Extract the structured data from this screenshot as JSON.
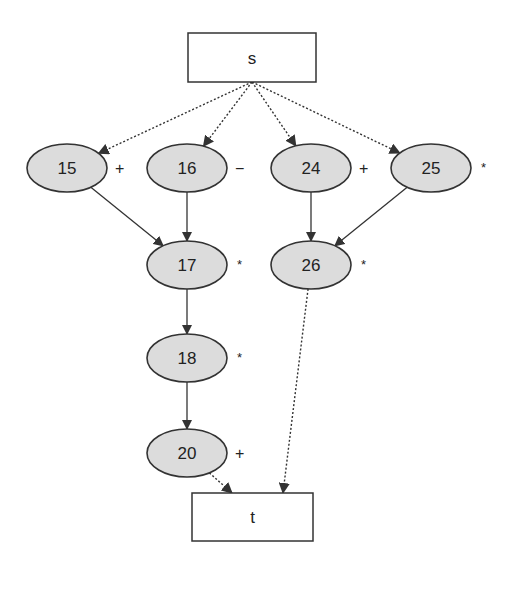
{
  "diagram": {
    "type": "dependency-graph",
    "source": {
      "id": "s",
      "label": "s",
      "x": 188,
      "y": 33,
      "w": 128,
      "h": 49
    },
    "sink": {
      "id": "t",
      "label": "t",
      "x": 192,
      "y": 493,
      "w": 121,
      "h": 48
    },
    "nodes": [
      {
        "id": "15",
        "label": "15",
        "op": "+",
        "cx": 67,
        "cy": 168
      },
      {
        "id": "16",
        "label": "16",
        "op": "−",
        "cx": 187,
        "cy": 168
      },
      {
        "id": "24",
        "label": "24",
        "op": "+",
        "cx": 311,
        "cy": 168
      },
      {
        "id": "25",
        "label": "25",
        "op": "*",
        "cx": 431,
        "cy": 168
      },
      {
        "id": "17",
        "label": "17",
        "op": "*",
        "cx": 187,
        "cy": 265
      },
      {
        "id": "26",
        "label": "26",
        "op": "*",
        "cx": 311,
        "cy": 265
      },
      {
        "id": "18",
        "label": "18",
        "op": "*",
        "cx": 187,
        "cy": 358
      },
      {
        "id": "20",
        "label": "20",
        "op": "+",
        "cx": 187,
        "cy": 453
      }
    ],
    "edges": [
      {
        "from": "s",
        "to": "15",
        "style": "dotted"
      },
      {
        "from": "s",
        "to": "16",
        "style": "dotted"
      },
      {
        "from": "s",
        "to": "24",
        "style": "dotted"
      },
      {
        "from": "s",
        "to": "25",
        "style": "dotted"
      },
      {
        "from": "15",
        "to": "17",
        "style": "solid"
      },
      {
        "from": "16",
        "to": "17",
        "style": "solid"
      },
      {
        "from": "24",
        "to": "26",
        "style": "solid"
      },
      {
        "from": "25",
        "to": "26",
        "style": "solid"
      },
      {
        "from": "17",
        "to": "18",
        "style": "solid"
      },
      {
        "from": "18",
        "to": "20",
        "style": "solid"
      },
      {
        "from": "20",
        "to": "t",
        "style": "dotted"
      },
      {
        "from": "26",
        "to": "t",
        "style": "dotted"
      }
    ],
    "colors": {
      "node_fill": "#dcdcdc",
      "stroke": "#333333",
      "box_fill": "#ffffff"
    }
  }
}
